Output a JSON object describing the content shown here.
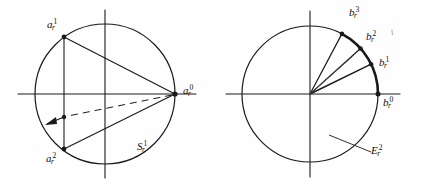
{
  "figure": {
    "caption": "",
    "background_color": "#fefefe",
    "ink_color": "#1a1a1a",
    "panels": [
      {
        "id": "left-panel",
        "name": "left-circle-diagram",
        "circle": {
          "cx": 105,
          "cy": 94,
          "r": 70
        },
        "axes": {
          "horizontal": {
            "x1": 18,
            "y1": 94,
            "x2": 196,
            "y2": 94
          },
          "vertical": {
            "x1": 105,
            "y1": 10,
            "x2": 105,
            "y2": 178
          }
        },
        "points": [
          {
            "key": "a1",
            "label_base": "a",
            "label_sub": "r",
            "label_sup": "1",
            "x": 64,
            "y": 37,
            "label_x": 48,
            "label_y": 20
          },
          {
            "key": "a0",
            "label_base": "a",
            "label_sub": "r",
            "label_sup": "0",
            "x": 175,
            "y": 94,
            "label_x": 182,
            "label_y": 86
          },
          {
            "key": "a2",
            "label_base": "a",
            "label_sub": "r",
            "label_sup": "2",
            "x": 64,
            "y": 149,
            "label_x": 47,
            "label_y": 155
          },
          {
            "key": "amid",
            "label_base": "",
            "label_sub": "",
            "label_sup": "",
            "x": 64,
            "y": 117,
            "label_x": 0,
            "label_y": 0
          }
        ],
        "region_label": {
          "base": "S",
          "sub": "r",
          "sup": "1",
          "x": 137,
          "y": 142
        }
      },
      {
        "id": "right-panel",
        "name": "right-circle-diagram",
        "circle": {
          "cx": 310,
          "cy": 94,
          "r": 68
        },
        "axes": {
          "horizontal": {
            "x1": 226,
            "y1": 94,
            "x2": 400,
            "y2": 94
          },
          "vertical": {
            "x1": 310,
            "y1": 11,
            "x2": 310,
            "y2": 177
          }
        },
        "points": [
          {
            "key": "b0",
            "label_base": "b",
            "label_sub": "r",
            "label_sup": "0",
            "angle_deg": 0,
            "label_x": 383,
            "label_y": 96
          },
          {
            "key": "b1",
            "label_base": "b",
            "label_sub": "r",
            "label_sup": "1",
            "angle_deg": 26,
            "label_x": 378,
            "label_y": 58
          },
          {
            "key": "b2",
            "label_base": "b",
            "label_sub": "r",
            "label_sup": "2",
            "angle_deg": 42,
            "label_x": 365,
            "label_y": 32
          },
          {
            "key": "b3",
            "label_base": "b",
            "label_sub": "r",
            "label_sup": "3",
            "angle_deg": 62,
            "label_x": 348,
            "label_y": 8
          }
        ],
        "arc": {
          "from_deg": 0,
          "to_deg": 62,
          "bold": true
        },
        "tick_mark": {
          "x": 393,
          "y": 30,
          "glyph": "\\"
        },
        "region_label": {
          "base": "E",
          "sub": "r",
          "sup": "2",
          "x": 372,
          "y": 145
        },
        "leader_line": {
          "x1": 330,
          "y1": 136,
          "x2": 371,
          "y2": 152
        }
      }
    ]
  }
}
